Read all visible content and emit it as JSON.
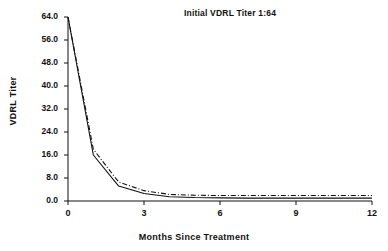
{
  "chart_data": {
    "type": "line",
    "title": "Initial VDRL Titer 1:64",
    "xlabel": "Months Since Treatment",
    "ylabel": "VDRL Titer",
    "x": [
      0,
      1,
      2,
      3,
      4,
      5,
      6,
      7,
      8,
      9,
      10,
      11,
      12
    ],
    "xlim": [
      0,
      12
    ],
    "ylim": [
      0,
      64
    ],
    "xticks": [
      0,
      3,
      6,
      9,
      12
    ],
    "xtick_labels": [
      "0",
      "3",
      "6",
      "9",
      "12"
    ],
    "yticks": [
      0,
      8,
      16,
      24,
      32,
      40,
      48,
      56,
      64
    ],
    "ytick_labels": [
      "0.0",
      "8.0",
      "16.0",
      "24.0",
      "32.0",
      "40.0",
      "48.0",
      "56.0",
      "64.0"
    ],
    "grid": false,
    "legend": "none",
    "series": [
      {
        "name": "solid-curve",
        "style": "solid",
        "color": "#111111",
        "values": [
          64.0,
          16.0,
          5.2,
          2.6,
          1.5,
          1.2,
          1.1,
          1.0,
          1.0,
          1.0,
          1.0,
          1.0,
          1.0
        ]
      },
      {
        "name": "dash-dot-curve",
        "style": "dash-dot",
        "color": "#111111",
        "values": [
          64.0,
          18.0,
          6.6,
          3.6,
          2.3,
          2.0,
          1.9,
          1.9,
          1.9,
          1.9,
          1.9,
          1.9,
          1.9
        ]
      }
    ]
  },
  "axes": {
    "y_label": "VDRL Titer",
    "x_label": "Months Since Treatment",
    "title": "Initial VDRL Titer 1:64"
  }
}
